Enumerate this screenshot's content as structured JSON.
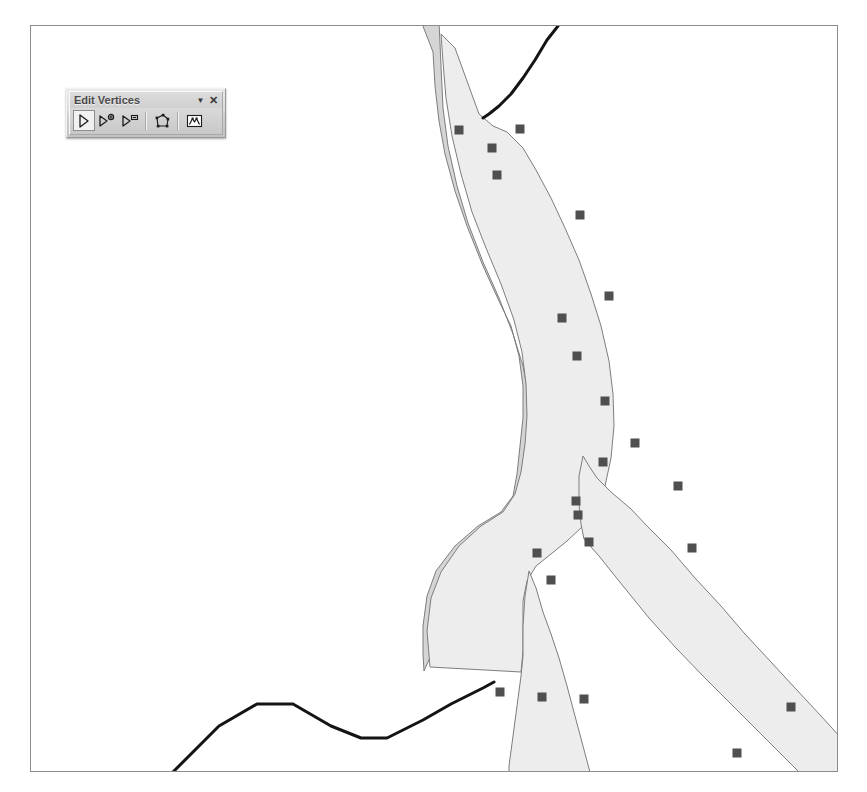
{
  "app": {
    "kind": "gis-editing-canvas"
  },
  "toolbar": {
    "title": "Edit Vertices",
    "chevron_label": "▼",
    "close_label": "✕",
    "tools": [
      {
        "name": "modify-sketch-vertices-tool",
        "tooltip": "Modify Sketch Vertices",
        "active": true
      },
      {
        "name": "add-vertex-tool",
        "tooltip": "Add Vertex",
        "active": false
      },
      {
        "name": "delete-vertex-tool",
        "tooltip": "Delete Vertex",
        "active": false
      },
      {
        "name": "continue-feature-tool",
        "tooltip": "Continue Feature",
        "active": false
      },
      {
        "name": "sketch-properties-tool",
        "tooltip": "Sketch Properties",
        "active": false
      }
    ]
  },
  "colors": {
    "canvas_background": "#ffffff",
    "canvas_border": "#8c8c8c",
    "polygon_left_fill": "#d5d5d5",
    "polygon_right_fill": "#ededed",
    "polygon_outline": "#7d7d7d",
    "vertex_handle": "#4f4f4f",
    "road_line": "#141414"
  },
  "map": {
    "width": 806,
    "height": 745,
    "layers": [
      {
        "name": "river-polygon-left",
        "type": "polygon",
        "fill": "#d5d5d5",
        "stroke": "#7d7d7d",
        "points": "210,-5 390,-5 402,26 404,60 408,95 414,128 424,165 436,200 452,240 468,275 480,300 488,330 492,360 492,392 489,420 486,448 482,470 470,486 447,500 424,520 405,545 396,570 392,600 392,628 393,645 397,636 404,620 412,600 424,580 440,560 460,540 476,522 486,505 492,485 498,462 500,437 500,405 498,372 492,340 482,308 468,272 452,236 437,197 426,160 417,120 412,82 410,40 408,-5 210,-5"
      },
      {
        "name": "river-polygon-right",
        "type": "polygon",
        "fill": "#ededed",
        "stroke": "#7d7d7d",
        "points": "399,641 396,605 400,572 410,546 428,520 450,500 472,486 484,468 490,446 494,418 496,390 495,358 491,326 483,294 470,258 455,222 441,186 430,148 421,110 415,72 412,36 410,8 424,22 432,44 440,66 448,88 462,100 476,106 492,122 505,144 520,172 534,202 548,234 560,268 570,300 578,335 582,368 583,400 580,432 574,460 565,482 552,500 536,515 520,528 505,540 496,555 492,575 492,600 492,625 490,646"
      },
      {
        "name": "river-branch-southeast",
        "type": "polygon",
        "fill": "#ededed",
        "stroke": "#7d7d7d",
        "points": "553,513 568,530 592,560 618,592 645,622 672,650 700,678 726,704 752,730 772,750 810,750 810,712 790,690 764,662 740,636 714,608 690,580 664,552 640,524 616,500 600,483 580,466 566,452 558,440 552,430 548,450 548,478 550,498"
      },
      {
        "name": "river-branch-south",
        "type": "polygon",
        "fill": "#ededed",
        "stroke": "#7d7d7d",
        "points": "492,600 492,630 490,650 486,680 482,710 478,740 478,750 560,750 552,720 544,690 536,660 528,632 520,608 512,586 505,562 498,545 494,570"
      },
      {
        "name": "road-line",
        "type": "polyline",
        "stroke": "#141414",
        "width": 3,
        "points": "120,768 188,700 226,678 262,678 300,700 330,712 356,712 392,694 420,678 440,668 452,662 463,656"
      },
      {
        "name": "road-line-north",
        "type": "polyline",
        "stroke": "#141414",
        "width": 3,
        "points": "527,0 516,14 504,34 492,52 480,68 468,80 458,88 452,92"
      }
    ],
    "vertices": [
      {
        "name": "vertex-01",
        "x": 428,
        "y": 104
      },
      {
        "name": "vertex-02",
        "x": 461,
        "y": 122
      },
      {
        "name": "vertex-03",
        "x": 489,
        "y": 103
      },
      {
        "name": "vertex-04",
        "x": 466,
        "y": 149
      },
      {
        "name": "vertex-05",
        "x": 549,
        "y": 189
      },
      {
        "name": "vertex-06",
        "x": 531,
        "y": 292
      },
      {
        "name": "vertex-07",
        "x": 578,
        "y": 270
      },
      {
        "name": "vertex-08",
        "x": 546,
        "y": 330
      },
      {
        "name": "vertex-09",
        "x": 574,
        "y": 375
      },
      {
        "name": "vertex-10",
        "x": 604,
        "y": 417
      },
      {
        "name": "vertex-11",
        "x": 572,
        "y": 436
      },
      {
        "name": "vertex-12",
        "x": 647,
        "y": 460
      },
      {
        "name": "vertex-13",
        "x": 545,
        "y": 475
      },
      {
        "name": "vertex-14",
        "x": 547,
        "y": 489
      },
      {
        "name": "vertex-15",
        "x": 506,
        "y": 527
      },
      {
        "name": "vertex-16",
        "x": 558,
        "y": 516
      },
      {
        "name": "vertex-17",
        "x": 661,
        "y": 522
      },
      {
        "name": "vertex-18",
        "x": 520,
        "y": 554
      },
      {
        "name": "vertex-19",
        "x": 469,
        "y": 666
      },
      {
        "name": "vertex-20",
        "x": 511,
        "y": 671
      },
      {
        "name": "vertex-21",
        "x": 553,
        "y": 673
      },
      {
        "name": "vertex-22",
        "x": 706,
        "y": 727
      },
      {
        "name": "vertex-23",
        "x": 760,
        "y": 681
      },
      {
        "name": "vertex-24",
        "x": 444,
        "y": 770
      }
    ]
  }
}
